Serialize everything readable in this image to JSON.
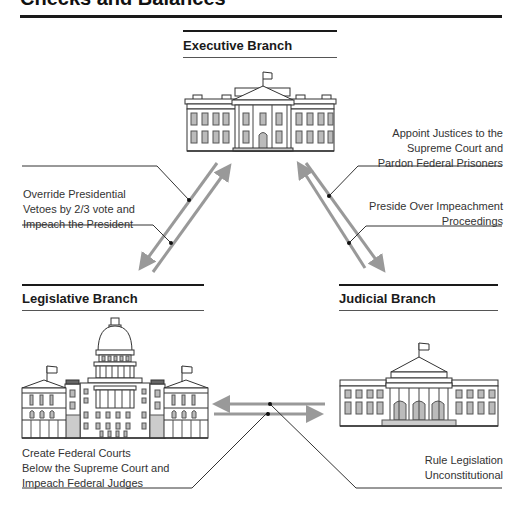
{
  "title": "Checks and Balances",
  "branches": {
    "executive": {
      "label": "Executive Branch",
      "icon": "white-house-icon"
    },
    "legislative": {
      "label": "Legislative Branch",
      "icon": "capitol-building-icon"
    },
    "judicial": {
      "label": "Judicial Branch",
      "icon": "supreme-court-icon"
    }
  },
  "checks": {
    "legislative_on_executive": [
      "Override Presidential",
      "Vetoes by 2/3 vote and",
      "Impeach the President"
    ],
    "executive_on_judicial": [
      "Appoint Justices to the",
      "Supreme Court and",
      "Pardon Federal Prisoners"
    ],
    "judicial_on_executive": [
      "Preside Over Impeachment",
      "Proceedings"
    ],
    "legislative_on_judicial": [
      "Create Federal Courts",
      "Below the Supreme Court and",
      "Impeach Federal Judges"
    ],
    "judicial_on_legislative": [
      "Rule Legislation",
      "Unconstitutional"
    ]
  },
  "colors": {
    "arrow": "#999999",
    "rule": "#1a1a1a",
    "text": "#333333"
  }
}
